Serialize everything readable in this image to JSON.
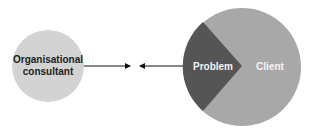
{
  "diagram": {
    "consultant": {
      "label_line1": "Organisational",
      "label_line2": "consultant",
      "fill": "#d3d3d3",
      "text_color": "#222222"
    },
    "client": {
      "label": "Client",
      "fill": "#a8a8a8",
      "text_color": "#f4f4f4"
    },
    "problem": {
      "label": "Problem",
      "fill": "#555555",
      "text_color": "#f4f4f4"
    },
    "arrows": [
      {
        "from": "consultant",
        "direction": "right"
      },
      {
        "from": "problem",
        "direction": "left"
      }
    ]
  }
}
